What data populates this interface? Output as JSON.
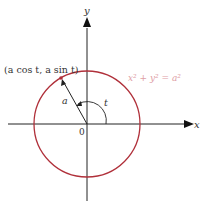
{
  "diagram": {
    "axes": {
      "x_label": "x",
      "y_label": "y",
      "origin_label": "0"
    },
    "circle": {
      "equation": "x² + y² = a²",
      "color": "#b0303a",
      "equation_color": "#e0a0a6"
    },
    "point": {
      "label": "(a cos t, a sin t)"
    },
    "radius_label": "a",
    "angle_label": "t"
  }
}
